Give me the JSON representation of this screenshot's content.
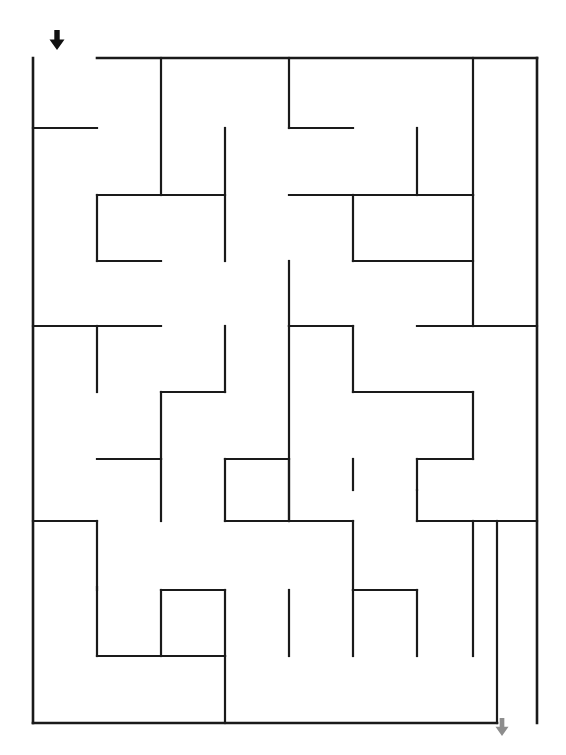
{
  "page": {
    "title": "Maze Puzzle",
    "background_color": "#ffffff",
    "width": 566,
    "height": 755
  },
  "maze": {
    "name": "rectangular-grid-maze",
    "wall_color": "#1a1a1a",
    "wall_thickness": 2.2,
    "columns": 8,
    "rows": 10,
    "origin_x": 33,
    "origin_y": 58,
    "cell_width": 63,
    "cell_height": 66.5,
    "entrance_label": "start",
    "exit_label": "finish",
    "entrance_arrow_color": "#111111",
    "exit_arrow_color": "#8d8d8d",
    "entrance_arrow_x": 57,
    "entrance_arrow_y": 40,
    "exit_arrow_x": 502,
    "exit_arrow_y": 727,
    "border_segments": [
      {
        "name": "left-border",
        "x1": 33,
        "y1": 58,
        "x2": 33,
        "y2": 723
      },
      {
        "name": "top-border-right-of-entrance",
        "x1": 97,
        "y1": 58,
        "x2": 537,
        "y2": 58
      },
      {
        "name": "right-border",
        "x1": 537,
        "y1": 58,
        "x2": 537,
        "y2": 723
      },
      {
        "name": "bottom-border-left-of-exit",
        "x1": 33,
        "y1": 723,
        "x2": 497,
        "y2": 723
      }
    ],
    "interior_segments": [
      {
        "x1": 33,
        "y1": 128,
        "x2": 97,
        "y2": 128
      },
      {
        "x1": 161,
        "y1": 58,
        "x2": 161,
        "y2": 195
      },
      {
        "x1": 289,
        "y1": 58,
        "x2": 289,
        "y2": 128
      },
      {
        "x1": 289,
        "y1": 128,
        "x2": 353,
        "y2": 128
      },
      {
        "x1": 473,
        "y1": 58,
        "x2": 473,
        "y2": 195
      },
      {
        "x1": 225,
        "y1": 128,
        "x2": 225,
        "y2": 261
      },
      {
        "x1": 417,
        "y1": 128,
        "x2": 417,
        "y2": 195
      },
      {
        "x1": 97,
        "y1": 195,
        "x2": 225,
        "y2": 195
      },
      {
        "x1": 97,
        "y1": 195,
        "x2": 97,
        "y2": 261
      },
      {
        "x1": 97,
        "y1": 261,
        "x2": 161,
        "y2": 261
      },
      {
        "x1": 289,
        "y1": 195,
        "x2": 473,
        "y2": 195
      },
      {
        "x1": 353,
        "y1": 195,
        "x2": 353,
        "y2": 261
      },
      {
        "x1": 353,
        "y1": 261,
        "x2": 473,
        "y2": 261
      },
      {
        "x1": 473,
        "y1": 195,
        "x2": 473,
        "y2": 326
      },
      {
        "x1": 33,
        "y1": 326,
        "x2": 161,
        "y2": 326
      },
      {
        "x1": 289,
        "y1": 261,
        "x2": 289,
        "y2": 326
      },
      {
        "x1": 289,
        "y1": 326,
        "x2": 353,
        "y2": 326
      },
      {
        "x1": 417,
        "y1": 326,
        "x2": 537,
        "y2": 326
      },
      {
        "x1": 97,
        "y1": 326,
        "x2": 97,
        "y2": 392
      },
      {
        "x1": 225,
        "y1": 326,
        "x2": 225,
        "y2": 392
      },
      {
        "x1": 289,
        "y1": 326,
        "x2": 289,
        "y2": 521
      },
      {
        "x1": 161,
        "y1": 392,
        "x2": 225,
        "y2": 392
      },
      {
        "x1": 161,
        "y1": 392,
        "x2": 161,
        "y2": 459
      },
      {
        "x1": 353,
        "y1": 392,
        "x2": 473,
        "y2": 392
      },
      {
        "x1": 473,
        "y1": 392,
        "x2": 473,
        "y2": 459
      },
      {
        "x1": 353,
        "y1": 326,
        "x2": 353,
        "y2": 392
      },
      {
        "x1": 97,
        "y1": 459,
        "x2": 161,
        "y2": 459
      },
      {
        "x1": 225,
        "y1": 459,
        "x2": 289,
        "y2": 459
      },
      {
        "x1": 353,
        "y1": 459,
        "x2": 353,
        "y2": 490
      },
      {
        "x1": 417,
        "y1": 459,
        "x2": 417,
        "y2": 490
      },
      {
        "x1": 33,
        "y1": 521,
        "x2": 97,
        "y2": 521
      },
      {
        "x1": 225,
        "y1": 459,
        "x2": 225,
        "y2": 521
      },
      {
        "x1": 225,
        "y1": 521,
        "x2": 353,
        "y2": 521
      },
      {
        "x1": 417,
        "y1": 490,
        "x2": 417,
        "y2": 521
      },
      {
        "x1": 417,
        "y1": 521,
        "x2": 537,
        "y2": 521
      },
      {
        "x1": 353,
        "y1": 521,
        "x2": 353,
        "y2": 656
      },
      {
        "x1": 473,
        "y1": 521,
        "x2": 473,
        "y2": 656
      },
      {
        "x1": 161,
        "y1": 590,
        "x2": 161,
        "y2": 656
      },
      {
        "x1": 161,
        "y1": 590,
        "x2": 225,
        "y2": 590
      },
      {
        "x1": 289,
        "y1": 590,
        "x2": 289,
        "y2": 656
      },
      {
        "x1": 353,
        "y1": 590,
        "x2": 417,
        "y2": 590
      },
      {
        "x1": 161,
        "y1": 656,
        "x2": 225,
        "y2": 656
      },
      {
        "x1": 97,
        "y1": 587,
        "x2": 97,
        "y2": 656
      },
      {
        "x1": 97,
        "y1": 656,
        "x2": 225,
        "y2": 656
      },
      {
        "x1": 225,
        "y1": 590,
        "x2": 225,
        "y2": 723
      },
      {
        "x1": 353,
        "y1": 590,
        "x2": 353,
        "y2": 590
      },
      {
        "x1": 417,
        "y1": 590,
        "x2": 417,
        "y2": 656
      },
      {
        "x1": 497,
        "y1": 521,
        "x2": 497,
        "y2": 723
      },
      {
        "x1": 161,
        "y1": 459,
        "x2": 161,
        "y2": 521
      },
      {
        "x1": 289,
        "y1": 459,
        "x2": 289,
        "y2": 521
      },
      {
        "x1": 417,
        "y1": 459,
        "x2": 473,
        "y2": 459
      },
      {
        "x1": 97,
        "y1": 521,
        "x2": 97,
        "y2": 590
      }
    ]
  },
  "annotations": {
    "start_arrow_name": "start-arrow",
    "exit_arrow_name": "exit-arrow"
  }
}
